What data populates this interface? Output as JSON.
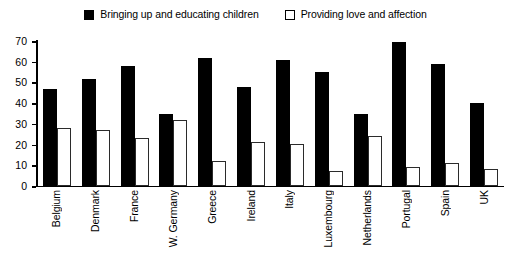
{
  "chart_data": {
    "type": "bar",
    "title": "",
    "subtitle": "",
    "xlabel": "",
    "ylabel": "",
    "ylim": [
      0,
      70
    ],
    "yticks": [
      0,
      10,
      20,
      30,
      40,
      50,
      60,
      70
    ],
    "grid": false,
    "legend_position": "top-center",
    "categories": [
      "Belgium",
      "Denmark",
      "France",
      "W. Germany",
      "Greece",
      "Ireland",
      "Italy",
      "Luxembourg",
      "Netherlands",
      "Portugal",
      "Spain",
      "UK"
    ],
    "series": [
      {
        "name": "Bringing up and educating children",
        "color": "#000000",
        "style": "filled",
        "values": [
          47,
          52,
          58,
          35,
          62,
          48,
          61,
          55,
          35,
          70,
          59,
          40
        ]
      },
      {
        "name": "Providing love and affection",
        "color": "#ffffff",
        "style": "open",
        "values": [
          28,
          27,
          23,
          32,
          12,
          21,
          20,
          7,
          24,
          9,
          11,
          8
        ]
      }
    ]
  },
  "legend": {
    "entries": [
      {
        "label": "Bringing up and educating children",
        "swatch": "filled-square-icon"
      },
      {
        "label": "Providing love and affection",
        "swatch": "open-square-icon"
      }
    ]
  },
  "axis": {
    "y_tick_labels": [
      "0",
      "10",
      "20",
      "30",
      "40",
      "50",
      "60",
      "70"
    ]
  }
}
